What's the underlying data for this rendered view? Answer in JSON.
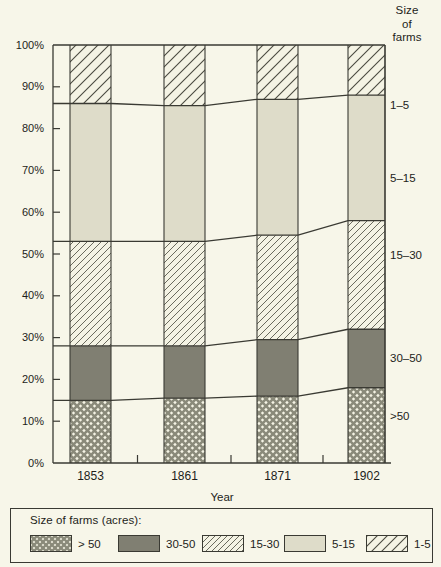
{
  "header": {
    "line1": "Size",
    "line2": "of",
    "line3": "farms"
  },
  "axis": {
    "x_title": "Year",
    "y_ticks": [
      "100%",
      "90%",
      "80%",
      "70%",
      "60%",
      "50%",
      "40%",
      "30%",
      "20%",
      "10%",
      "0%"
    ],
    "x_ticks": [
      "1853",
      "1861",
      "1871",
      "1902"
    ]
  },
  "right_labels": [
    {
      "text": "1–5"
    },
    {
      "text": "5–15"
    },
    {
      "text": "15–30"
    },
    {
      "text": "30–50"
    },
    {
      "text": ">50"
    }
  ],
  "legend": {
    "title": "Size of farms (acres):",
    "items": [
      {
        "label": "> 50",
        "pattern": "crosshatch",
        "color": "#b4b3a2"
      },
      {
        "label": "30-50",
        "pattern": "solid",
        "color": "#807f72"
      },
      {
        "label": "15-30",
        "pattern": "diagonal-thin",
        "color": "#f2f1e2"
      },
      {
        "label": "5-15",
        "pattern": "flat-light",
        "color": "#dedcc9"
      },
      {
        "label": "1-5",
        "pattern": "diagonal-wide",
        "color": "#f2f1e2"
      }
    ]
  },
  "colors": {
    "background": "#f7f6e9",
    "ink": "#3a3a33",
    "gray_dark": "#807f72",
    "gray_light": "#dedcc9",
    "hatch_fill": "#f4f3e4"
  },
  "chart_data": {
    "type": "area",
    "title": "",
    "subtitle": "",
    "xlabel": "Year",
    "ylabel": "",
    "ylim": [
      0,
      100
    ],
    "grid": false,
    "legend_position": "bottom",
    "stacked": true,
    "units": "percent",
    "categories": [
      "1853",
      "1861",
      "1871",
      "1902"
    ],
    "series": [
      {
        "name": "> 50",
        "values": [
          15,
          15.5,
          16,
          18
        ]
      },
      {
        "name": "30-50",
        "values": [
          13,
          12.5,
          13.5,
          14
        ]
      },
      {
        "name": "15-30",
        "values": [
          25,
          24.5,
          25,
          26
        ]
      },
      {
        "name": "5-15",
        "values": [
          33,
          32.5,
          32,
          30
        ]
      },
      {
        "name": "1-5",
        "values": [
          14,
          15,
          13.5,
          12
        ]
      }
    ],
    "cumulative_boundaries": {
      "gt50_top": [
        15,
        15.5,
        16,
        18
      ],
      "a30_50_top": [
        28,
        28,
        29.5,
        32
      ],
      "a15_30_top": [
        53,
        53,
        54.5,
        58
      ],
      "a5_15_top": [
        86,
        85.5,
        87,
        88
      ],
      "a1_5_top": [
        100,
        100,
        100,
        100
      ]
    }
  }
}
